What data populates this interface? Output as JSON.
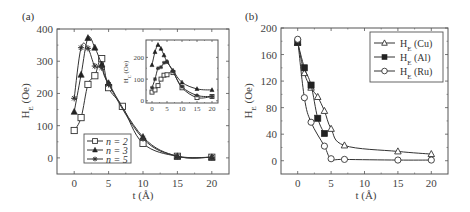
{
  "chart_data": [
    {
      "panel": "(a)",
      "type": "line",
      "title": "",
      "xlabel": "t (Å)",
      "ylabel": "H_E (Oe)",
      "xlim": [
        -2.5,
        22.5
      ],
      "ylim": [
        -50,
        400
      ],
      "xticks": [
        0,
        5,
        10,
        15,
        20
      ],
      "yticks": [
        0,
        100,
        200,
        300,
        400
      ],
      "legend_position": "lower-left-center",
      "series": [
        {
          "name": "n = 2",
          "marker": "open-square",
          "x": [
            0,
            1,
            2,
            3,
            4,
            5,
            7,
            10,
            15,
            20
          ],
          "y": [
            85,
            125,
            228,
            255,
            308,
            218,
            160,
            45,
            5,
            2
          ]
        },
        {
          "name": "n = 3",
          "marker": "filled-triangle",
          "x": [
            0,
            1,
            2,
            3,
            4,
            5,
            10,
            15,
            20
          ],
          "y": [
            143,
            258,
            372,
            342,
            290,
            232,
            65,
            5,
            2
          ]
        },
        {
          "name": "n = 5",
          "marker": "star",
          "x": [
            0,
            1,
            2,
            3,
            4,
            5,
            10,
            15,
            20
          ],
          "y": [
            185,
            342,
            340,
            285,
            280,
            228,
            60,
            5,
            2
          ]
        }
      ],
      "inset": {
        "type": "line",
        "ylabel": "H_C (Oe)",
        "xticks": [
          0,
          5,
          10,
          15,
          20
        ],
        "yticks": [
          0,
          100,
          200
        ],
        "series": [
          {
            "name": "n = 2",
            "marker": "open-square",
            "x": [
              0,
              1,
              2,
              3,
              4,
              5,
              7,
              10,
              15,
              20
            ],
            "y": [
              40,
              50,
              70,
              100,
              118,
              120,
              130,
              60,
              15,
              20
            ]
          },
          {
            "name": "n = 3",
            "marker": "filled-triangle",
            "x": [
              0,
              1,
              2,
              3,
              4,
              5,
              7,
              10,
              15,
              20
            ],
            "y": [
              165,
              225,
              258,
              240,
              210,
              180,
              140,
              85,
              55,
              50
            ]
          },
          {
            "name": "n = 5",
            "marker": "star",
            "x": [
              0,
              1,
              2,
              3,
              4,
              5,
              7,
              10,
              15,
              20
            ],
            "y": [
              60,
              100,
              150,
              155,
              175,
              180,
              135,
              65,
              25,
              20
            ]
          }
        ]
      }
    },
    {
      "panel": "(b)",
      "type": "line",
      "title": "",
      "xlabel": "t (Å)",
      "ylabel": "H_E (Oe)",
      "xlim": [
        -2.5,
        22.5
      ],
      "ylim": [
        -20,
        200
      ],
      "xticks": [
        0,
        5,
        10,
        15,
        20
      ],
      "yticks": [
        0,
        40,
        80,
        120,
        160,
        200
      ],
      "legend_position": "upper-right",
      "series": [
        {
          "name": "H_E (Cu)",
          "marker": "open-triangle",
          "x": [
            0,
            1,
            2,
            3,
            4,
            5,
            7,
            15,
            20
          ],
          "y": [
            178,
            132,
            110,
            96,
            75,
            48,
            23,
            14,
            10
          ]
        },
        {
          "name": "H_E (Al)",
          "marker": "filled-square",
          "x": [
            0,
            1,
            2,
            3,
            4
          ],
          "y": [
            178,
            140,
            114,
            64,
            41
          ]
        },
        {
          "name": "H_E (Ru)",
          "marker": "open-circle",
          "x": [
            0,
            1,
            2,
            4,
            5,
            7,
            15,
            20
          ],
          "y": [
            183,
            95,
            58,
            22,
            3,
            2,
            1,
            1
          ]
        }
      ]
    }
  ],
  "labels": {
    "panel_a": "(a)",
    "panel_b": "(b)",
    "xlabel": "t (Å)",
    "ylabel_main": "H",
    "ylabel_sub": "E",
    "ylabel_unit": " (Oe)",
    "inset_ylabel_main": "H",
    "inset_ylabel_sub": "C",
    "inset_ylabel_unit": " (Oe)",
    "legend_a": [
      "n = 2",
      "n = 3",
      "n = 5"
    ],
    "legend_b_main": "H",
    "legend_b_sub": "E",
    "legend_b_units": [
      " (Cu)",
      " (Al)",
      " (Ru)"
    ]
  },
  "colors": {
    "line": "#333333",
    "frame": "#555555",
    "text": "#444444"
  }
}
